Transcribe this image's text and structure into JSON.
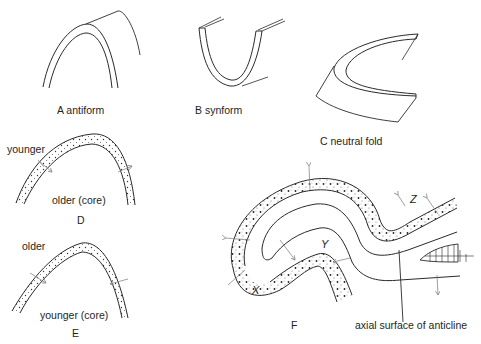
{
  "figure": {
    "clipped_title_fragment": "",
    "panels": [
      {
        "id": "A",
        "caption": "A antiform"
      },
      {
        "id": "B",
        "caption": "B synform"
      },
      {
        "id": "C",
        "caption": "C neutral fold"
      },
      {
        "id": "D",
        "caption": "D",
        "labels": {
          "outer": "younger",
          "core": "older (core)"
        }
      },
      {
        "id": "E",
        "caption": "E",
        "labels": {
          "outer": "older",
          "core": "younger (core)"
        }
      },
      {
        "id": "F",
        "caption": "F",
        "points": [
          "X",
          "Y",
          "Z"
        ],
        "annotation": "axial surface of anticline"
      }
    ]
  },
  "colors": {
    "line": "#2a2a2a",
    "arrow": "#8a8a8a",
    "background": "#ffffff"
  }
}
